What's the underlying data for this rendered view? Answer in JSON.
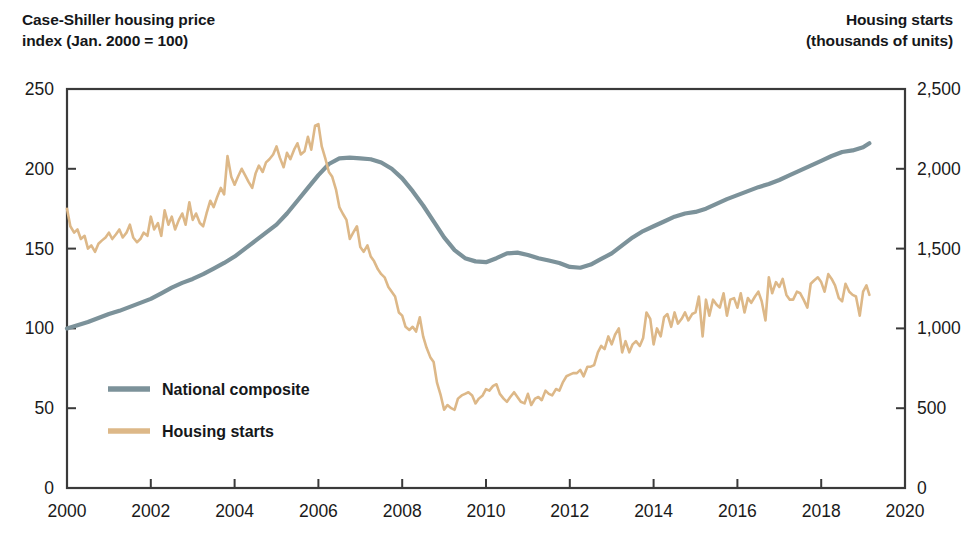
{
  "axis_titles": {
    "left": "Case-Shiller housing price\nindex (Jan. 2000 = 100)",
    "right": "Housing starts\n(thousands of units)"
  },
  "legend": {
    "items": [
      {
        "label": "National composite",
        "color": "#7c929a"
      },
      {
        "label": "Housing starts",
        "color": "#ddb888"
      }
    ]
  },
  "chart_data": {
    "type": "line",
    "title": "",
    "subtitle": "",
    "xlabel": "",
    "ylabel": "Case-Shiller housing price index (Jan. 2000 = 100)",
    "y2label": "Housing starts (thousands of units)",
    "grid": false,
    "legend_position": "inside-lower-left",
    "xlim": [
      2000,
      2020
    ],
    "ylim": [
      0,
      250
    ],
    "y2lim": [
      0,
      2500
    ],
    "xticks": [
      2000,
      2002,
      2004,
      2006,
      2008,
      2010,
      2012,
      2014,
      2016,
      2018,
      2020
    ],
    "xticklabels": [
      "2000",
      "2002",
      "2004",
      "2006",
      "2008",
      "2010",
      "2012",
      "2014",
      "2016",
      "2018",
      "2020"
    ],
    "yticks": [
      0,
      50,
      100,
      150,
      200,
      250
    ],
    "yticklabels": [
      "0",
      "50",
      "100",
      "150",
      "200",
      "250"
    ],
    "y2ticks": [
      0,
      500,
      1000,
      1500,
      2000,
      2500
    ],
    "y2ticklabels": [
      "0",
      "500",
      "1,000",
      "1,500",
      "2,000",
      "2,500"
    ],
    "series": [
      {
        "name": "National composite",
        "color": "#7c929a",
        "axis": "left",
        "units": "index (Jan. 2000 = 100)",
        "x": [
          2000.0,
          2000.25,
          2000.5,
          2000.75,
          2001.0,
          2001.25,
          2001.5,
          2001.75,
          2002.0,
          2002.25,
          2002.5,
          2002.75,
          2003.0,
          2003.25,
          2003.5,
          2003.75,
          2004.0,
          2004.25,
          2004.5,
          2004.75,
          2005.0,
          2005.25,
          2005.5,
          2005.75,
          2006.0,
          2006.25,
          2006.5,
          2006.75,
          2007.0,
          2007.25,
          2007.5,
          2007.75,
          2008.0,
          2008.25,
          2008.5,
          2008.75,
          2009.0,
          2009.25,
          2009.5,
          2009.75,
          2010.0,
          2010.25,
          2010.5,
          2010.75,
          2011.0,
          2011.25,
          2011.5,
          2011.75,
          2012.0,
          2012.25,
          2012.5,
          2012.75,
          2013.0,
          2013.25,
          2013.5,
          2013.75,
          2014.0,
          2014.25,
          2014.5,
          2014.75,
          2015.0,
          2015.25,
          2015.5,
          2015.75,
          2016.0,
          2016.25,
          2016.5,
          2016.75,
          2017.0,
          2017.25,
          2017.5,
          2017.75,
          2018.0,
          2018.25,
          2018.5,
          2018.75,
          2019.0,
          2019.15
        ],
        "y": [
          100,
          102,
          104,
          106.5,
          109,
          111,
          113.5,
          116,
          118.5,
          122,
          125.5,
          128.5,
          131,
          134,
          137.5,
          141,
          145,
          150,
          155,
          160,
          165,
          172,
          180,
          188,
          196,
          203,
          206.5,
          207,
          206.5,
          206,
          204,
          200,
          194,
          186,
          177,
          167,
          157,
          149,
          144,
          142,
          141.5,
          144,
          147,
          147.5,
          146,
          144,
          142.5,
          141,
          138.5,
          138,
          140,
          143.5,
          147,
          152,
          157,
          161,
          164,
          167,
          170,
          172,
          173,
          175,
          178,
          181,
          183.5,
          186,
          188.5,
          190.5,
          193,
          196,
          199,
          202,
          205,
          208,
          210.5,
          211.5,
          213.5,
          216
        ]
      },
      {
        "name": "Housing starts",
        "color": "#ddb888",
        "axis": "right",
        "units": "thousands of units (SAAR)",
        "x": [
          2000.0,
          2000.08,
          2000.17,
          2000.25,
          2000.33,
          2000.42,
          2000.5,
          2000.58,
          2000.67,
          2000.75,
          2000.83,
          2000.92,
          2001.0,
          2001.08,
          2001.17,
          2001.25,
          2001.33,
          2001.42,
          2001.5,
          2001.58,
          2001.67,
          2001.75,
          2001.83,
          2001.92,
          2002.0,
          2002.08,
          2002.17,
          2002.25,
          2002.33,
          2002.42,
          2002.5,
          2002.58,
          2002.67,
          2002.75,
          2002.83,
          2002.92,
          2003.0,
          2003.08,
          2003.17,
          2003.25,
          2003.33,
          2003.42,
          2003.5,
          2003.58,
          2003.67,
          2003.75,
          2003.83,
          2003.92,
          2004.0,
          2004.08,
          2004.17,
          2004.25,
          2004.33,
          2004.42,
          2004.5,
          2004.58,
          2004.67,
          2004.75,
          2004.83,
          2004.92,
          2005.0,
          2005.08,
          2005.17,
          2005.25,
          2005.33,
          2005.42,
          2005.5,
          2005.58,
          2005.67,
          2005.75,
          2005.83,
          2005.92,
          2006.0,
          2006.08,
          2006.17,
          2006.25,
          2006.33,
          2006.42,
          2006.5,
          2006.58,
          2006.67,
          2006.75,
          2006.83,
          2006.92,
          2007.0,
          2007.08,
          2007.17,
          2007.25,
          2007.33,
          2007.42,
          2007.5,
          2007.58,
          2007.67,
          2007.75,
          2007.83,
          2007.92,
          2008.0,
          2008.08,
          2008.17,
          2008.25,
          2008.33,
          2008.42,
          2008.5,
          2008.58,
          2008.67,
          2008.75,
          2008.83,
          2008.92,
          2009.0,
          2009.08,
          2009.17,
          2009.25,
          2009.33,
          2009.42,
          2009.5,
          2009.58,
          2009.67,
          2009.75,
          2009.83,
          2009.92,
          2010.0,
          2010.08,
          2010.17,
          2010.25,
          2010.33,
          2010.42,
          2010.5,
          2010.58,
          2010.67,
          2010.75,
          2010.83,
          2010.92,
          2011.0,
          2011.08,
          2011.17,
          2011.25,
          2011.33,
          2011.42,
          2011.5,
          2011.58,
          2011.67,
          2011.75,
          2011.83,
          2011.92,
          2012.0,
          2012.08,
          2012.17,
          2012.25,
          2012.33,
          2012.42,
          2012.5,
          2012.58,
          2012.67,
          2012.75,
          2012.83,
          2012.92,
          2013.0,
          2013.08,
          2013.17,
          2013.25,
          2013.33,
          2013.42,
          2013.5,
          2013.58,
          2013.67,
          2013.75,
          2013.83,
          2013.92,
          2014.0,
          2014.08,
          2014.17,
          2014.25,
          2014.33,
          2014.42,
          2014.5,
          2014.58,
          2014.67,
          2014.75,
          2014.83,
          2014.92,
          2015.0,
          2015.08,
          2015.17,
          2015.25,
          2015.33,
          2015.42,
          2015.5,
          2015.58,
          2015.67,
          2015.75,
          2015.83,
          2015.92,
          2016.0,
          2016.08,
          2016.17,
          2016.25,
          2016.33,
          2016.42,
          2016.5,
          2016.58,
          2016.67,
          2016.75,
          2016.83,
          2016.92,
          2017.0,
          2017.08,
          2017.17,
          2017.25,
          2017.33,
          2017.42,
          2017.5,
          2017.58,
          2017.67,
          2017.75,
          2017.83,
          2017.92,
          2018.0,
          2018.08,
          2018.17,
          2018.25,
          2018.33,
          2018.42,
          2018.5,
          2018.58,
          2018.67,
          2018.75,
          2018.83,
          2018.92,
          2019.0,
          2019.08,
          2019.15
        ],
        "y": [
          1750,
          1640,
          1600,
          1620,
          1560,
          1580,
          1500,
          1520,
          1480,
          1530,
          1550,
          1570,
          1600,
          1560,
          1590,
          1620,
          1570,
          1600,
          1650,
          1570,
          1540,
          1560,
          1600,
          1580,
          1700,
          1620,
          1660,
          1580,
          1740,
          1650,
          1700,
          1620,
          1680,
          1720,
          1650,
          1790,
          1680,
          1720,
          1660,
          1640,
          1720,
          1800,
          1760,
          1820,
          1880,
          1840,
          2080,
          1950,
          1900,
          1950,
          2000,
          1960,
          1920,
          1880,
          1970,
          2020,
          1980,
          2040,
          2060,
          2090,
          2140,
          2070,
          2010,
          2100,
          2060,
          2120,
          2160,
          2090,
          2110,
          2200,
          2120,
          2270,
          2280,
          2140,
          2060,
          1980,
          1950,
          1870,
          1760,
          1720,
          1680,
          1560,
          1600,
          1640,
          1510,
          1480,
          1520,
          1450,
          1420,
          1370,
          1340,
          1320,
          1260,
          1230,
          1200,
          1100,
          1080,
          1010,
          990,
          1010,
          980,
          1070,
          950,
          880,
          820,
          790,
          660,
          580,
          490,
          520,
          500,
          490,
          560,
          580,
          590,
          600,
          580,
          530,
          560,
          580,
          620,
          610,
          640,
          650,
          590,
          560,
          540,
          570,
          600,
          570,
          540,
          530,
          590,
          520,
          560,
          570,
          550,
          610,
          590,
          580,
          620,
          610,
          660,
          700,
          710,
          720,
          720,
          740,
          700,
          760,
          760,
          770,
          850,
          890,
          870,
          950,
          900,
          960,
          1000,
          850,
          920,
          850,
          900,
          920,
          890,
          940,
          1100,
          1060,
          900,
          1000,
          950,
          1070,
          1090,
          1010,
          1100,
          1030,
          1060,
          1100,
          1050,
          1090,
          1100,
          1200,
          950,
          1180,
          1080,
          1180,
          1150,
          1130,
          1220,
          1080,
          1180,
          1190,
          1130,
          1220,
          1100,
          1190,
          1160,
          1200,
          1230,
          1170,
          1050,
          1320,
          1220,
          1290,
          1260,
          1310,
          1210,
          1180,
          1180,
          1230,
          1220,
          1180,
          1130,
          1280,
          1300,
          1320,
          1290,
          1230,
          1340,
          1310,
          1270,
          1190,
          1170,
          1280,
          1230,
          1210,
          1200,
          1080,
          1230,
          1270,
          1210
        ]
      }
    ],
    "annotations": {
      "peak_housing_starts": {
        "x": 2005.92,
        "y": 2280,
        "label": ""
      },
      "trough_housing_starts": {
        "x": 2009.0,
        "y": 490,
        "label": ""
      },
      "peak_index": {
        "x": 2006.75,
        "y": 207,
        "label": ""
      },
      "trough_index": {
        "x": 2012.08,
        "y": 138,
        "label": ""
      }
    }
  }
}
